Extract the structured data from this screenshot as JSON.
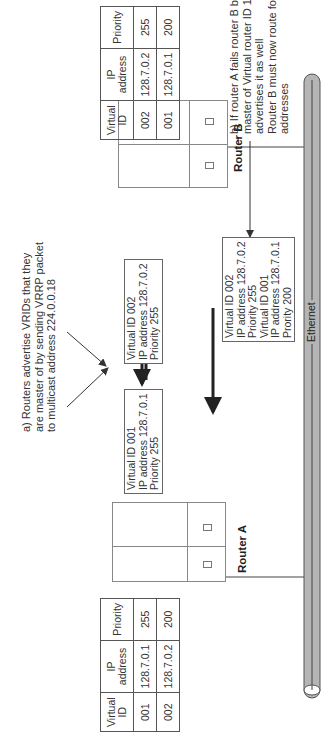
{
  "diagram": {
    "orientation": "rotated 90deg counter-clockwise",
    "table_a": {
      "headers": [
        "Virtual ID",
        "IP address",
        "Priority"
      ],
      "rows": [
        [
          "001",
          "128.7.0.1",
          "255"
        ],
        [
          "002",
          "128.7.0.2",
          "200"
        ]
      ]
    },
    "table_b": {
      "headers": [
        "Virtual ID",
        "IP address",
        "Priority"
      ],
      "rows": [
        [
          "002",
          "128.7.0.2",
          "255"
        ],
        [
          "001",
          "128.7.0.1",
          "200"
        ]
      ]
    },
    "router_a": {
      "label": "Router A"
    },
    "router_b": {
      "label": "Router B"
    },
    "note_a": {
      "lines": [
        "a) Routers  advertise VRIDs that they",
        "are master of by sending VRRP packet",
        "to multicast address 224.0.0.18"
      ]
    },
    "note_b": {
      "lines": [
        "b) If router A fails router B becomes",
        "master of Virtual router ID 1 and",
        "advertises it as well",
        "Router B must now route for both",
        "addresses"
      ]
    },
    "adv_a": {
      "lines": [
        "Virtual ID 001",
        "IP address 128.7.0.1",
        "Priority 255"
      ]
    },
    "adv_b": {
      "lines": [
        "Virtual ID 002",
        "IP address 128.7.0.2",
        "Priority 255"
      ]
    },
    "adv_b_failover": {
      "lines": [
        "Virtual ID 002",
        "IP address 128.7.0.2",
        "Priority 255",
        "Virtual ID 001",
        "IP address 128.7.0.1",
        "Prority 200"
      ]
    },
    "ethernet": {
      "label": "Ethernet"
    },
    "colors": {
      "line": "#333333",
      "ethernet_fill": "#b5b5b5",
      "ethernet_stroke": "#555555",
      "box_border": "#666666"
    }
  }
}
